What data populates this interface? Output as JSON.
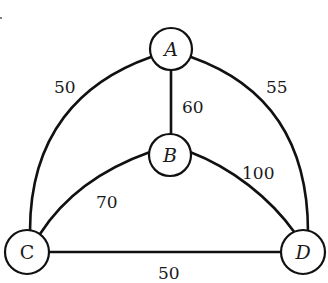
{
  "diagram": {
    "type": "weighted-undirected-graph",
    "nodes": [
      {
        "id": "A",
        "label": "A",
        "x": 171,
        "y": 49
      },
      {
        "id": "B",
        "label": "B",
        "x": 170,
        "y": 155
      },
      {
        "id": "C",
        "label": "C",
        "x": 27,
        "y": 252
      },
      {
        "id": "D",
        "label": "D",
        "x": 303,
        "y": 252
      }
    ],
    "edges": [
      {
        "from": "A",
        "to": "C",
        "weight": "50",
        "shape": "arc-left"
      },
      {
        "from": "A",
        "to": "D",
        "weight": "55",
        "shape": "arc-right"
      },
      {
        "from": "A",
        "to": "B",
        "weight": "60",
        "shape": "straight"
      },
      {
        "from": "B",
        "to": "C",
        "weight": "70",
        "shape": "curve"
      },
      {
        "from": "B",
        "to": "D",
        "weight": "100",
        "shape": "curve"
      },
      {
        "from": "C",
        "to": "D",
        "weight": "50",
        "shape": "straight"
      }
    ]
  }
}
